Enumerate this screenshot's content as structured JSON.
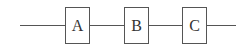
{
  "diagram": {
    "type": "series-block-diagram",
    "blocks": [
      {
        "label": "A",
        "x": 65
      },
      {
        "label": "B",
        "x": 124
      },
      {
        "label": "C",
        "x": 182
      }
    ],
    "wires": [
      {
        "from": "input",
        "to": "A",
        "x1": 20,
        "x2": 65
      },
      {
        "from": "A",
        "to": "B",
        "x1": 90,
        "x2": 124
      },
      {
        "from": "B",
        "to": "C",
        "x1": 149,
        "x2": 182
      },
      {
        "from": "C",
        "to": "output",
        "x1": 207,
        "x2": 236
      }
    ],
    "colors": {
      "line": "#555555",
      "text": "#333333",
      "background": "#ffffff"
    }
  }
}
